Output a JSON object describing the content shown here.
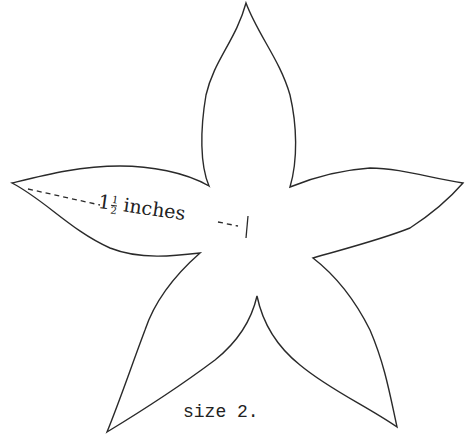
{
  "figure": {
    "shape": "five-pointed star / flower petal pattern",
    "stroke_color": "#2a2a2a",
    "background_color": "#ffffff"
  },
  "measurement": {
    "whole": "1",
    "frac_num": "1",
    "frac_den": "2",
    "unit": "inches"
  },
  "caption": {
    "text": "size 2."
  }
}
